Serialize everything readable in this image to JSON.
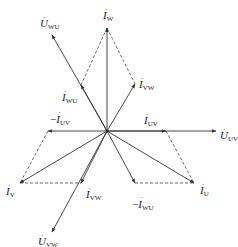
{
  "diagram": {
    "type": "phasor-diagram",
    "origin": [
      107,
      131
    ],
    "colors": {
      "line": "#333333",
      "dashed": "#444444",
      "text": "#222222"
    },
    "vectors": [
      {
        "id": "U_UV",
        "from": [
          107,
          131
        ],
        "to": [
          216,
          131
        ],
        "style": "solid"
      },
      {
        "id": "I_UV",
        "from": [
          107,
          131
        ],
        "to": [
          166,
          131
        ],
        "style": "solid"
      },
      {
        "id": "minus_I_UV",
        "from": [
          107,
          131
        ],
        "to": [
          48,
          131
        ],
        "style": "solid"
      },
      {
        "id": "I_W",
        "from": [
          107,
          131
        ],
        "to": [
          107,
          28
        ],
        "style": "solid"
      },
      {
        "id": "U_WU",
        "from": [
          107,
          131
        ],
        "to": [
          52,
          35
        ],
        "style": "solid"
      },
      {
        "id": "I_WU",
        "from": [
          107,
          131
        ],
        "to": [
          81,
          85
        ],
        "style": "solid"
      },
      {
        "id": "I_VW_upper",
        "from": [
          107,
          131
        ],
        "to": [
          135,
          84
        ],
        "style": "solid"
      },
      {
        "id": "I_V",
        "from": [
          107,
          131
        ],
        "to": [
          20,
          183
        ],
        "style": "solid"
      },
      {
        "id": "U_VW",
        "from": [
          107,
          131
        ],
        "to": [
          52,
          232
        ],
        "style": "solid"
      },
      {
        "id": "I_VW_lower",
        "from": [
          107,
          131
        ],
        "to": [
          81,
          183
        ],
        "style": "solid"
      },
      {
        "id": "I_U",
        "from": [
          107,
          131
        ],
        "to": [
          194,
          183
        ],
        "style": "solid"
      },
      {
        "id": "minus_I_WU",
        "from": [
          107,
          131
        ],
        "to": [
          135,
          183
        ],
        "style": "solid"
      }
    ],
    "dashed_lines": [
      {
        "from": [
          107,
          28
        ],
        "to": [
          81,
          85
        ]
      },
      {
        "from": [
          107,
          28
        ],
        "to": [
          135,
          84
        ]
      },
      {
        "from": [
          48,
          131
        ],
        "to": [
          20,
          183
        ]
      },
      {
        "from": [
          20,
          183
        ],
        "to": [
          81,
          183
        ]
      },
      {
        "from": [
          166,
          131
        ],
        "to": [
          194,
          183
        ]
      },
      {
        "from": [
          135,
          183
        ],
        "to": [
          194,
          183
        ]
      }
    ],
    "labels": {
      "U_WU": {
        "main": "U",
        "sub": "WU",
        "prefix": ""
      },
      "I_W": {
        "main": "I",
        "sub": "W",
        "prefix": ""
      },
      "I_VW_upper": {
        "main": "I",
        "sub": "VW",
        "prefix": ""
      },
      "I_WU": {
        "main": "I",
        "sub": "WU",
        "prefix": ""
      },
      "minus_I_UV": {
        "main": "I",
        "sub": "UV",
        "prefix": "−"
      },
      "I_UV": {
        "main": "I",
        "sub": "UV",
        "prefix": ""
      },
      "U_UV": {
        "main": "U",
        "sub": "UV",
        "prefix": ""
      },
      "I_V": {
        "main": "I",
        "sub": "V",
        "prefix": ""
      },
      "I_VW_lower": {
        "main": "I",
        "sub": "VW",
        "prefix": ""
      },
      "I_U": {
        "main": "I",
        "sub": "U",
        "prefix": ""
      },
      "minus_I_WU": {
        "main": "I",
        "sub": "WU",
        "prefix": "−"
      },
      "U_VW": {
        "main": "U",
        "sub": "VW",
        "prefix": ""
      }
    },
    "dot_symbol": "·"
  }
}
